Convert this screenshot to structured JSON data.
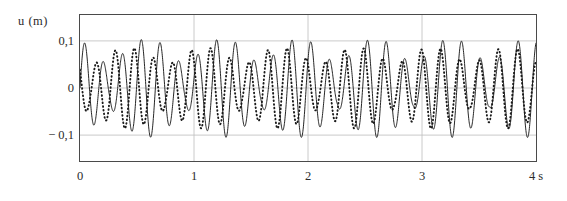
{
  "axes": {
    "y_axis_title": "u  (m)",
    "x_unit_label": "4 s",
    "y_ticks": [
      "0,1",
      "0",
      "− 0,1"
    ],
    "x_ticks": [
      "0",
      "1",
      "2",
      "3"
    ]
  },
  "chart_data": {
    "type": "line",
    "title": "",
    "xlabel": "t (s)",
    "ylabel": "u (m)",
    "xlim": [
      0,
      4
    ],
    "ylim": [
      -0.155,
      0.155
    ],
    "y_tick_values": [
      0.1,
      0,
      -0.1
    ],
    "y_tick_labels": [
      "0,1",
      "0",
      "− 0,1"
    ],
    "x_tick_values": [
      0,
      1,
      2,
      3,
      4
    ],
    "x_tick_labels": [
      "0",
      "1",
      "2",
      "3",
      "4 s"
    ],
    "grid": true,
    "legend": false,
    "series": [
      {
        "name": "solid-wave",
        "style": "solid",
        "color": "#1a1a1a",
        "amplitude": 0.105,
        "carrier_hz": 6.05,
        "beat_hz": 1.5,
        "beat_depth": 0.62,
        "phase": 0.0,
        "beat_phase": 0.35,
        "drift": 0.0
      },
      {
        "name": "dotted-wave",
        "style": "dotted",
        "color": "#1a1a1a",
        "amplitude": 0.086,
        "carrier_hz": 6.05,
        "beat_hz": 1.5,
        "beat_depth": 0.5,
        "phase": 2.45,
        "beat_phase": 1.15,
        "drift": -2.45
      }
    ]
  },
  "layout": {
    "plot_left": 79,
    "plot_top": 14,
    "plot_width": 458,
    "plot_height": 148,
    "y_label_x": 18,
    "y_label_y": 10
  }
}
